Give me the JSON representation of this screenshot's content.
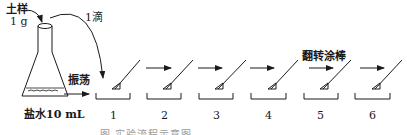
{
  "labels": {
    "soil_sample": "土样",
    "soil_mass": "1 g",
    "one_drop": "1滴",
    "shake": "振荡",
    "saline": "盐水10 mL",
    "flip_spreader": "翻转涂棒"
  },
  "plates": [
    {
      "number": "1"
    },
    {
      "number": "2"
    },
    {
      "number": "3"
    },
    {
      "number": "4"
    },
    {
      "number": "5"
    },
    {
      "number": "6"
    }
  ],
  "caption": "图  实验流程示意图",
  "colors": {
    "line": "#1a1a1a",
    "caption": "#9a9a9a"
  }
}
